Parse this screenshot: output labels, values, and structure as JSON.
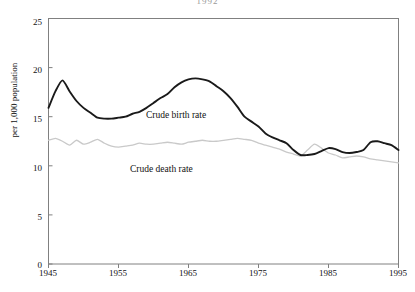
{
  "figure": {
    "top_note": "1992",
    "ylabel": "per 1,000 population",
    "series_labels": {
      "birth": "Crude birth rate",
      "death": "Crude death rate"
    },
    "colors": {
      "birth_line": "#1a1a1a",
      "death_line": "#c9c9c9",
      "axis": "#808080",
      "text": "#111111",
      "background": "#ffffff"
    }
  },
  "chart_data": {
    "type": "line",
    "title": "",
    "subtitle": "",
    "xlabel": "",
    "ylabel": "per 1,000 population",
    "xlim": [
      1945,
      1995
    ],
    "ylim": [
      0,
      25
    ],
    "xticks": [
      1945,
      1955,
      1965,
      1975,
      1985,
      1995
    ],
    "yticks": [
      0,
      5,
      10,
      15,
      20,
      25
    ],
    "xtick_labels": [
      "1945",
      "1955",
      "1965",
      "1975",
      "1985",
      "1995"
    ],
    "ytick_labels": [
      "0",
      "5",
      "10",
      "15",
      "20",
      "25"
    ],
    "grid": false,
    "legend": "inline-annotations",
    "annotations": [
      {
        "text": "Crude birth rate",
        "x": 1966,
        "y": 15.2
      },
      {
        "text": "Crude death rate",
        "x": 1962,
        "y": 10.9
      }
    ],
    "x": [
      1945,
      1946,
      1947,
      1948,
      1949,
      1950,
      1951,
      1952,
      1953,
      1954,
      1955,
      1956,
      1957,
      1958,
      1959,
      1960,
      1961,
      1962,
      1963,
      1964,
      1965,
      1966,
      1967,
      1968,
      1969,
      1970,
      1971,
      1972,
      1973,
      1974,
      1975,
      1976,
      1977,
      1978,
      1979,
      1980,
      1981,
      1982,
      1983,
      1984,
      1985,
      1986,
      1987,
      1988,
      1989,
      1990,
      1991,
      1992,
      1993,
      1994,
      1995
    ],
    "series": [
      {
        "name": "Crude birth rate",
        "color": "#1a1a1a",
        "values": [
          15.9,
          17.6,
          18.7,
          17.6,
          16.6,
          15.9,
          15.4,
          14.9,
          14.8,
          14.8,
          14.9,
          15.0,
          15.3,
          15.5,
          15.9,
          16.4,
          16.9,
          17.3,
          18.0,
          18.5,
          18.8,
          18.9,
          18.8,
          18.6,
          18.1,
          17.6,
          16.9,
          16.0,
          15.0,
          14.5,
          14.0,
          13.3,
          12.9,
          12.6,
          12.3,
          11.6,
          11.1,
          11.1,
          11.2,
          11.5,
          11.8,
          11.7,
          11.4,
          11.3,
          11.4,
          11.6,
          12.4,
          12.5,
          12.3,
          12.1,
          11.6
        ]
      },
      {
        "name": "Crude death rate",
        "color": "#c9c9c9",
        "values": [
          12.6,
          12.8,
          12.5,
          12.1,
          12.6,
          12.2,
          12.4,
          12.7,
          12.3,
          12.0,
          11.9,
          12.0,
          12.1,
          12.3,
          12.2,
          12.2,
          12.3,
          12.4,
          12.3,
          12.2,
          12.4,
          12.5,
          12.6,
          12.5,
          12.5,
          12.6,
          12.7,
          12.8,
          12.7,
          12.6,
          12.3,
          12.1,
          11.9,
          11.7,
          11.4,
          11.2,
          11.0,
          11.6,
          12.2,
          11.8,
          11.3,
          11.1,
          10.8,
          10.9,
          11.0,
          10.9,
          10.7,
          10.6,
          10.5,
          10.4,
          10.3
        ]
      }
    ]
  }
}
